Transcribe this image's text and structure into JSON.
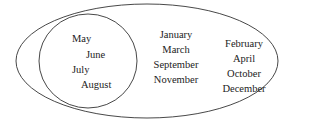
{
  "diagram": {
    "type": "venn",
    "outer_set": {
      "shape": "ellipse",
      "inner_subset": {
        "shape": "circle",
        "members": [
          "May",
          "June",
          "July",
          "August"
        ]
      },
      "middle_group": [
        "January",
        "March",
        "September",
        "November"
      ],
      "right_group": [
        "February",
        "April",
        "October",
        "December"
      ]
    },
    "stroke_color": "#333333"
  }
}
